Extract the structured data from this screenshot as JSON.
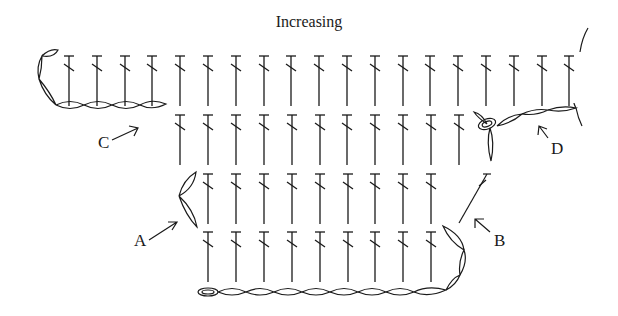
{
  "title": "Increasing",
  "colors": {
    "ink": "#1a1a1a",
    "background": "#ffffff"
  },
  "diagram": {
    "type": "crochet-stitch-chart",
    "stitch_symbol": "double-crochet",
    "rows": [
      {
        "name": "row-1-top",
        "y": 56,
        "x_start": 69,
        "count": 19,
        "spacing": 27.8
      },
      {
        "name": "row-2",
        "y": 115,
        "x_start": 180,
        "count": 11,
        "spacing": 27.9
      },
      {
        "name": "row-3",
        "y": 174,
        "x_start": 208,
        "count": 9,
        "spacing": 27.9
      },
      {
        "name": "row-4",
        "y": 232,
        "x_start": 208,
        "count": 9,
        "spacing": 27.9
      }
    ],
    "labels": [
      {
        "id": "A",
        "text": "A",
        "x": 140,
        "y": 245
      },
      {
        "id": "B",
        "text": "B",
        "x": 498,
        "y": 245
      },
      {
        "id": "C",
        "text": "C",
        "x": 97,
        "y": 147
      },
      {
        "id": "D",
        "text": "D",
        "x": 552,
        "y": 153
      }
    ]
  }
}
